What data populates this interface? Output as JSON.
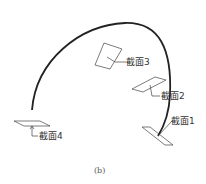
{
  "figure": {
    "caption": "(b)",
    "colors": {
      "curve": "#222222",
      "outline": "#444444",
      "text": "#333333"
    }
  },
  "sections": [
    {
      "id": 1,
      "label": "截面1"
    },
    {
      "id": 2,
      "label": "截面2"
    },
    {
      "id": 3,
      "label": "截面3"
    },
    {
      "id": 4,
      "label": "截面4"
    }
  ]
}
